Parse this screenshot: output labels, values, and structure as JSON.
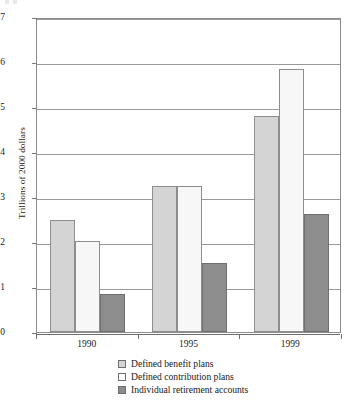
{
  "chart_data": {
    "type": "bar",
    "title": "",
    "subtitle": "",
    "xlabel": "",
    "ylabel": "Trillions of 2000 dollars",
    "categories": [
      "1990",
      "1995",
      "1999"
    ],
    "series": [
      {
        "name": "Defined benefit plans",
        "values": [
          2.48,
          3.25,
          4.8
        ],
        "color": "#d4d4d4"
      },
      {
        "name": "Defined contribution plans",
        "values": [
          2.02,
          3.25,
          5.85
        ],
        "color": "#f7f7f7"
      },
      {
        "name": "Individual retirement accounts",
        "values": [
          0.85,
          1.53,
          2.62
        ],
        "color": "#8d8d8d"
      }
    ],
    "ylim": [
      0,
      7
    ],
    "yticks": [
      "0",
      "1",
      "2",
      "3",
      "4",
      "5",
      "6",
      "7"
    ],
    "grid": true,
    "legend_position": "bottom"
  },
  "axis": {
    "y_title": "Trillions of 2000 dollars",
    "y_ticks": [
      "7",
      "6",
      "5",
      "4",
      "3",
      "2",
      "1",
      "0"
    ],
    "x_ticks": [
      "1990",
      "1995",
      "1999"
    ]
  },
  "legend": {
    "items": [
      {
        "label": "Defined benefit plans"
      },
      {
        "label": "Defined contribution plans"
      },
      {
        "label": "Individual retirement accounts"
      }
    ]
  }
}
